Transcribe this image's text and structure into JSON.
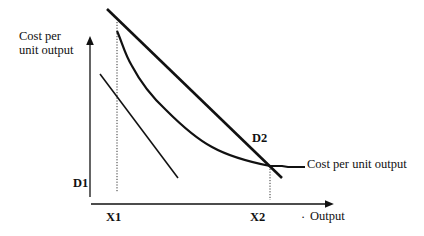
{
  "diagram": {
    "y_axis_label_line1": "Cost per",
    "y_axis_label_line2": "unit output",
    "x_axis_label": "Output",
    "x_axis_dot": "·",
    "curve_label": "Cost per unit output",
    "d1_label": "D1",
    "d2_label": "D2",
    "x1_label": "X1",
    "x2_label": "X2",
    "colors": {
      "ink": "#111111",
      "background": "#ffffff"
    }
  }
}
